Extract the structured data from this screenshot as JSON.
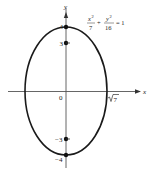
{
  "diagram": {
    "type": "ellipse-graph",
    "equation": {
      "term1_num": "x",
      "term1_exp": "2",
      "term1_den": "7",
      "plus": "+",
      "term2_num": "y",
      "term2_exp": "2",
      "term2_den": "16",
      "equals": "= 1"
    },
    "axes": {
      "x_label": "x",
      "y_label": "y",
      "origin_label": "0"
    },
    "points": {
      "top": "4",
      "upper_focus": "3",
      "lower_focus": "−3",
      "bottom": "−4",
      "right_intercept_radicand": "7"
    },
    "colors": {
      "curve": "#1a1a1a",
      "axis": "#555555"
    }
  }
}
